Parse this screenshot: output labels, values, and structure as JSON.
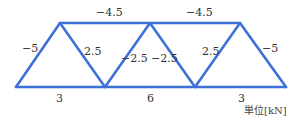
{
  "colors": {
    "member": "#3f6fd8",
    "text": "#333333",
    "background": "#ffffff"
  },
  "unit_label": "単位[kN]",
  "nodes": {
    "A": [
      16,
      87
    ],
    "B": [
      105,
      87
    ],
    "C": [
      195,
      87
    ],
    "D": [
      286,
      87
    ],
    "E": [
      60,
      23
    ],
    "F": [
      150,
      23
    ],
    "G": [
      240,
      23
    ]
  },
  "members": [
    {
      "id": "AE",
      "force": "−5",
      "label_pos": [
        31,
        52
      ]
    },
    {
      "id": "EB",
      "force": "2.5",
      "label_pos": [
        86,
        56
      ]
    },
    {
      "id": "BF",
      "force": "−2.5",
      "label_pos": [
        128,
        63
      ]
    },
    {
      "id": "FC",
      "force": "−2.5",
      "label_pos": [
        152,
        63
      ]
    },
    {
      "id": "CG",
      "force": "2.5",
      "label_pos": [
        204,
        56
      ]
    },
    {
      "id": "GD",
      "force": "−5",
      "label_pos": [
        262,
        52
      ]
    },
    {
      "id": "EF",
      "force": "−4.5",
      "label_pos": [
        105,
        17
      ]
    },
    {
      "id": "FG",
      "force": "−4.5",
      "label_pos": [
        195,
        17
      ]
    },
    {
      "id": "AB",
      "force": "3",
      "label_pos": [
        59,
        104
      ]
    },
    {
      "id": "BC",
      "force": "6",
      "label_pos": [
        150,
        104
      ]
    },
    {
      "id": "CD",
      "force": "3",
      "label_pos": [
        240,
        104
      ]
    }
  ],
  "labels": {
    "AE": "−5",
    "EB": "2.5",
    "BF": "−2.5",
    "FC": "−2.5",
    "CG": "2.5",
    "GD": "−5",
    "EF": "−4.5",
    "FG": "−4.5",
    "AB": "3",
    "BC": "6",
    "CD": "3"
  }
}
